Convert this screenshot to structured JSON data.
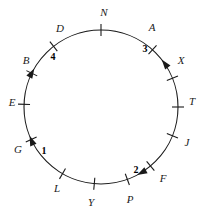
{
  "figure": {
    "background_color": "#ffffff",
    "stroke_color": "#1a1a1a",
    "circle": {
      "center_x": 101,
      "center_y": 107,
      "radius": 77,
      "stroke_width": 1.1
    },
    "tick": {
      "inner_offset": -6,
      "outer_offset": 6,
      "stroke_width": 1.1
    },
    "letters": [
      {
        "text": "N",
        "angle_deg": 0,
        "label_x": 104,
        "label_y": 12
      },
      {
        "text": "A",
        "angle_deg": 42,
        "label_x": 152,
        "label_y": 27
      },
      {
        "text": "X",
        "angle_deg": 68,
        "label_x": 181,
        "label_y": 60
      },
      {
        "text": "T",
        "angle_deg": 90,
        "label_x": 192,
        "label_y": 101
      },
      {
        "text": "J",
        "angle_deg": 112,
        "label_x": 187,
        "label_y": 142
      },
      {
        "text": "F",
        "angle_deg": 140,
        "label_x": 163,
        "label_y": 178
      },
      {
        "text": "P",
        "angle_deg": 160,
        "label_x": 130,
        "label_y": 199
      },
      {
        "text": "Y",
        "angle_deg": 185,
        "label_x": 91,
        "label_y": 202
      },
      {
        "text": "L",
        "angle_deg": 210,
        "label_x": 57,
        "label_y": 188
      },
      {
        "text": "G",
        "angle_deg": 245,
        "label_x": 18,
        "label_y": 149
      },
      {
        "text": "E",
        "angle_deg": 272,
        "label_x": 12,
        "label_y": 102
      },
      {
        "text": "B",
        "angle_deg": 296,
        "label_x": 26,
        "label_y": 60
      },
      {
        "text": "D",
        "angle_deg": 322,
        "label_x": 60,
        "label_y": 28
      }
    ],
    "arrows": [
      {
        "label": "1",
        "angle_deg": 248,
        "direction": "clockwise",
        "label_x": 44,
        "label_y": 151
      },
      {
        "label": "2",
        "angle_deg": 152,
        "direction": "clockwise",
        "label_x": 136,
        "label_y": 170
      },
      {
        "label": "3",
        "angle_deg": 52,
        "direction": "counterclockwise",
        "label_x": 145,
        "label_y": 49
      },
      {
        "label": "4",
        "angle_deg": 300,
        "direction": "clockwise",
        "label_x": 53,
        "label_y": 57
      }
    ]
  }
}
